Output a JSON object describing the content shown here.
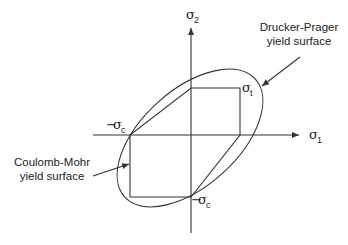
{
  "diagram": {
    "axes": {
      "x_label": {
        "symbol": "σ",
        "subscript": "1"
      },
      "y_label": {
        "symbol": "σ",
        "subscript": "2"
      }
    },
    "points": {
      "tension": {
        "symbol": "σ",
        "subscript": "t"
      },
      "compression_x": {
        "prefix": "−",
        "symbol": "σ",
        "subscript": "c"
      },
      "compression_y": {
        "prefix": "−",
        "symbol": "σ",
        "subscript": "c"
      }
    },
    "annotations": {
      "drucker_prager": {
        "line1": "Drucker-Prager",
        "line2": "yield surface"
      },
      "coulomb_mohr": {
        "line1": "Coulomb-Mohr",
        "line2": "yield surface"
      }
    },
    "colors": {
      "line": "#333333",
      "background": "#ffffff"
    }
  }
}
